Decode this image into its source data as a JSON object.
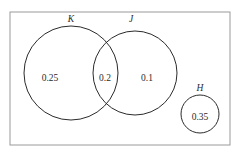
{
  "figure": {
    "type": "venn-diagram",
    "background_color": "#ffffff",
    "stroke_color": "#2b2b2b",
    "frame_color": "#9a9a9a"
  },
  "universe": {
    "label": "",
    "x": 10,
    "y": 12,
    "width": 220,
    "height": 133
  },
  "sets": [
    {
      "id": "K",
      "label": "K",
      "cx": 71,
      "cy": 73,
      "r": 47,
      "label_x": 71,
      "label_y": 22
    },
    {
      "id": "J",
      "label": "J",
      "cx": 135,
      "cy": 73,
      "r": 42,
      "label_x": 131,
      "label_y": 22
    },
    {
      "id": "H",
      "label": "H",
      "cx": 200,
      "cy": 114,
      "r": 19,
      "label_x": 200,
      "label_y": 91
    }
  ],
  "regions": [
    {
      "id": "K-only",
      "value": "0.25",
      "x": 50,
      "y": 81
    },
    {
      "id": "K-and-J",
      "value": "0.2",
      "x": 105,
      "y": 81
    },
    {
      "id": "J-only",
      "value": "0.1",
      "x": 147,
      "y": 81
    },
    {
      "id": "H-only",
      "value": "0.35",
      "x": 200,
      "y": 120
    }
  ]
}
